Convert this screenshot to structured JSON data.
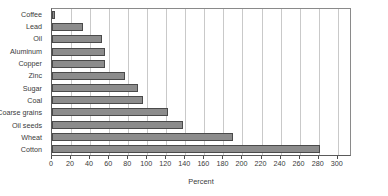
{
  "chart_data": {
    "type": "bar",
    "orientation": "horizontal",
    "title": "",
    "xlabel": "Percent",
    "ylabel": "",
    "xlim": [
      0,
      315
    ],
    "ylim": null,
    "grid": "vertical gridlines at each x tick",
    "legend": null,
    "xticks": [
      0,
      20,
      40,
      60,
      80,
      100,
      120,
      140,
      160,
      180,
      200,
      220,
      240,
      260,
      280,
      300
    ],
    "xtick_labels": [
      "0",
      "20",
      "40",
      "60",
      "80",
      "100",
      "120",
      "140",
      "160",
      "180",
      "200",
      "220",
      "240",
      "260",
      "280",
      "300"
    ],
    "categories": [
      "Coffee",
      "Lead",
      "Oil",
      "Aluminum",
      "Copper",
      "Zinc",
      "Sugar",
      "Coal",
      "Coarse grains",
      "Oil seeds",
      "Wheat",
      "Cotton"
    ],
    "values": [
      3,
      33,
      53,
      56,
      56,
      77,
      90,
      96,
      122,
      138,
      190,
      281
    ],
    "bar_color": "#8c8c8c",
    "bar_edge_color": "#4a4a4a",
    "grid_color": "#c9c9c9",
    "axis_color": "#4a4a4a"
  }
}
